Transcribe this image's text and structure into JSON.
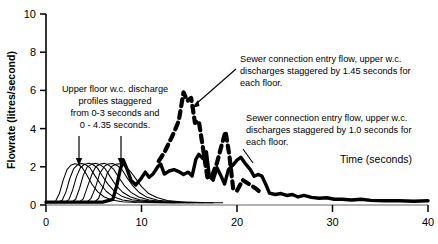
{
  "chart_data": {
    "type": "line",
    "title": "",
    "xlabel": "Time (seconds)",
    "ylabel": "Flowrate (litres/second)",
    "xlim": [
      0,
      40
    ],
    "ylim": [
      0,
      10
    ],
    "xticks": [
      0,
      10,
      20,
      30,
      40
    ],
    "yticks": [
      0,
      2,
      4,
      6,
      8,
      10
    ],
    "grid": false,
    "legend": "none",
    "series": [
      {
        "name": "Upper floor w.c. discharge profile 1",
        "style": "thin-solid",
        "points": [
          [
            0.6,
            0.12
          ],
          [
            1.0,
            0.2
          ],
          [
            1.4,
            0.6
          ],
          [
            1.8,
            1.3
          ],
          [
            2.2,
            1.85
          ],
          [
            2.6,
            2.08
          ],
          [
            3.0,
            2.16
          ],
          [
            3.4,
            2.12
          ],
          [
            3.8,
            1.95
          ],
          [
            4.3,
            1.55
          ],
          [
            4.8,
            1.1
          ],
          [
            5.4,
            0.7
          ],
          [
            6.1,
            0.42
          ],
          [
            7.0,
            0.25
          ],
          [
            8.0,
            0.17
          ],
          [
            9.5,
            0.13
          ],
          [
            11.5,
            0.12
          ],
          [
            13.5,
            0.12
          ]
        ]
      },
      {
        "name": "Upper floor w.c. discharge profile 2",
        "style": "thin-solid",
        "points": [
          [
            1.2,
            0.12
          ],
          [
            1.7,
            0.25
          ],
          [
            2.1,
            0.7
          ],
          [
            2.5,
            1.4
          ],
          [
            2.9,
            1.9
          ],
          [
            3.3,
            2.1
          ],
          [
            3.7,
            2.17
          ],
          [
            4.1,
            2.13
          ],
          [
            4.6,
            1.95
          ],
          [
            5.1,
            1.55
          ],
          [
            5.7,
            1.1
          ],
          [
            6.3,
            0.72
          ],
          [
            7.0,
            0.45
          ],
          [
            8.0,
            0.26
          ],
          [
            9.2,
            0.18
          ],
          [
            10.8,
            0.14
          ],
          [
            12.5,
            0.12
          ],
          [
            14.0,
            0.12
          ]
        ]
      },
      {
        "name": "Upper floor w.c. discharge profile 3",
        "style": "thin-solid",
        "points": [
          [
            1.9,
            0.12
          ],
          [
            2.4,
            0.28
          ],
          [
            2.8,
            0.8
          ],
          [
            3.2,
            1.5
          ],
          [
            3.6,
            1.95
          ],
          [
            4.0,
            2.12
          ],
          [
            4.5,
            2.18
          ],
          [
            4.9,
            2.12
          ],
          [
            5.4,
            1.93
          ],
          [
            5.9,
            1.52
          ],
          [
            6.5,
            1.08
          ],
          [
            7.2,
            0.7
          ],
          [
            8.0,
            0.44
          ],
          [
            9.0,
            0.27
          ],
          [
            10.3,
            0.19
          ],
          [
            12.0,
            0.14
          ],
          [
            13.5,
            0.12
          ],
          [
            15.0,
            0.12
          ]
        ]
      },
      {
        "name": "Upper floor w.c. discharge profile 4",
        "style": "thin-solid",
        "points": [
          [
            2.6,
            0.12
          ],
          [
            3.1,
            0.3
          ],
          [
            3.5,
            0.85
          ],
          [
            3.9,
            1.55
          ],
          [
            4.3,
            1.98
          ],
          [
            4.8,
            2.14
          ],
          [
            5.2,
            2.18
          ],
          [
            5.7,
            2.1
          ],
          [
            6.2,
            1.9
          ],
          [
            6.7,
            1.5
          ],
          [
            7.3,
            1.05
          ],
          [
            8.0,
            0.68
          ],
          [
            8.8,
            0.43
          ],
          [
            9.8,
            0.27
          ],
          [
            11.2,
            0.19
          ],
          [
            12.8,
            0.14
          ],
          [
            14.2,
            0.12
          ],
          [
            15.5,
            0.12
          ]
        ]
      },
      {
        "name": "Upper floor w.c. discharge profile 5",
        "style": "thin-solid",
        "points": [
          [
            3.4,
            0.12
          ],
          [
            3.9,
            0.32
          ],
          [
            4.3,
            0.9
          ],
          [
            4.8,
            1.6
          ],
          [
            5.2,
            2.0
          ],
          [
            5.7,
            2.15
          ],
          [
            6.1,
            2.18
          ],
          [
            6.6,
            2.08
          ],
          [
            7.1,
            1.86
          ],
          [
            7.6,
            1.46
          ],
          [
            8.2,
            1.02
          ],
          [
            8.9,
            0.66
          ],
          [
            9.7,
            0.42
          ],
          [
            10.8,
            0.26
          ],
          [
            12.2,
            0.18
          ],
          [
            13.8,
            0.14
          ],
          [
            15.2,
            0.12
          ],
          [
            16.5,
            0.12
          ]
        ]
      },
      {
        "name": "Upper floor w.c. discharge profile 6",
        "style": "thin-solid",
        "points": [
          [
            4.2,
            0.12
          ],
          [
            4.7,
            0.33
          ],
          [
            5.2,
            0.95
          ],
          [
            5.6,
            1.62
          ],
          [
            6.1,
            2.02
          ],
          [
            6.5,
            2.15
          ],
          [
            7.0,
            2.17
          ],
          [
            7.5,
            2.05
          ],
          [
            8.0,
            1.82
          ],
          [
            8.5,
            1.42
          ],
          [
            9.1,
            1.0
          ],
          [
            9.8,
            0.64
          ],
          [
            10.6,
            0.4
          ],
          [
            11.7,
            0.25
          ],
          [
            13.1,
            0.18
          ],
          [
            14.6,
            0.14
          ],
          [
            16.0,
            0.12
          ],
          [
            17.5,
            0.12
          ]
        ]
      },
      {
        "name": "Upper floor w.c. discharge profile 7",
        "style": "thin-solid",
        "points": [
          [
            5.0,
            0.12
          ],
          [
            5.5,
            0.34
          ],
          [
            6.0,
            0.98
          ],
          [
            6.4,
            1.65
          ],
          [
            6.9,
            2.03
          ],
          [
            7.4,
            2.15
          ],
          [
            7.8,
            2.16
          ],
          [
            8.3,
            2.02
          ],
          [
            8.8,
            1.78
          ],
          [
            9.4,
            1.38
          ],
          [
            10.0,
            0.96
          ],
          [
            10.7,
            0.62
          ],
          [
            11.6,
            0.39
          ],
          [
            12.7,
            0.24
          ],
          [
            14.1,
            0.17
          ],
          [
            15.6,
            0.14
          ],
          [
            17.0,
            0.12
          ],
          [
            18.5,
            0.12
          ]
        ]
      },
      {
        "name": "Sewer connection entry flow, 1.0 second stagger",
        "style": "thick-solid",
        "points": [
          [
            0.0,
            0.15
          ],
          [
            2.0,
            0.15
          ],
          [
            4.0,
            0.15
          ],
          [
            6.0,
            0.16
          ],
          [
            7.0,
            0.3
          ],
          [
            7.4,
            1.0
          ],
          [
            7.8,
            1.9
          ],
          [
            8.1,
            2.35
          ],
          [
            8.5,
            1.85
          ],
          [
            8.9,
            1.3
          ],
          [
            9.4,
            1.05
          ],
          [
            9.9,
            1.35
          ],
          [
            10.4,
            1.72
          ],
          [
            10.8,
            1.45
          ],
          [
            11.2,
            1.62
          ],
          [
            11.7,
            2.0
          ],
          [
            12.0,
            2.15
          ],
          [
            12.4,
            1.62
          ],
          [
            12.9,
            1.78
          ],
          [
            13.4,
            1.85
          ],
          [
            13.9,
            1.75
          ],
          [
            14.4,
            1.6
          ],
          [
            14.9,
            1.72
          ],
          [
            15.3,
            1.52
          ],
          [
            15.7,
            2.4
          ],
          [
            16.0,
            2.65
          ],
          [
            16.4,
            2.45
          ],
          [
            16.8,
            2.78
          ],
          [
            17.1,
            1.5
          ],
          [
            17.5,
            1.3
          ],
          [
            17.9,
            1.95
          ],
          [
            18.3,
            1.55
          ],
          [
            18.7,
            1.1
          ],
          [
            19.1,
            1.85
          ],
          [
            19.6,
            2.1
          ],
          [
            20.0,
            2.35
          ],
          [
            20.4,
            2.5
          ],
          [
            20.9,
            2.15
          ],
          [
            21.4,
            1.85
          ],
          [
            21.8,
            1.5
          ],
          [
            22.2,
            1.6
          ],
          [
            22.6,
            1.52
          ],
          [
            23.0,
            1.1
          ],
          [
            23.4,
            0.62
          ],
          [
            24.0,
            0.55
          ],
          [
            24.6,
            0.6
          ],
          [
            25.2,
            0.5
          ],
          [
            25.8,
            0.55
          ],
          [
            26.4,
            0.42
          ],
          [
            27.0,
            0.5
          ],
          [
            27.8,
            0.4
          ],
          [
            28.6,
            0.35
          ],
          [
            29.4,
            0.38
          ],
          [
            30.2,
            0.3
          ],
          [
            31.0,
            0.3
          ],
          [
            32.0,
            0.26
          ],
          [
            33.0,
            0.3
          ],
          [
            34.0,
            0.24
          ],
          [
            35.5,
            0.22
          ],
          [
            37.0,
            0.22
          ],
          [
            38.5,
            0.2
          ],
          [
            40.0,
            0.22
          ]
        ]
      },
      {
        "name": "Sewer connection entry flow, 1.45 second stagger",
        "style": "thick-dashed",
        "points": [
          [
            11.8,
            2.3
          ],
          [
            12.4,
            2.75
          ],
          [
            13.4,
            3.8
          ],
          [
            13.9,
            4.4
          ],
          [
            14.4,
            5.9
          ],
          [
            14.8,
            5.45
          ],
          [
            15.2,
            5.6
          ],
          [
            15.6,
            4.3
          ],
          [
            16.0,
            4.4
          ],
          [
            16.4,
            3.1
          ],
          [
            16.9,
            1.45
          ],
          [
            17.4,
            1.55
          ],
          [
            17.9,
            2.2
          ],
          [
            18.4,
            3.15
          ],
          [
            18.8,
            3.85
          ],
          [
            19.2,
            2.6
          ],
          [
            19.6,
            0.85
          ],
          [
            20.0,
            0.75
          ],
          [
            20.6,
            1.3
          ],
          [
            21.4,
            1.05
          ],
          [
            22.0,
            0.85
          ],
          [
            22.6,
            0.6
          ]
        ]
      }
    ],
    "annotations": [
      {
        "id": "annot-upper-floor",
        "text_lines": [
          "Upper floor w.c. discharge",
          "profiles staggered",
          "from 0-3 seconds and",
          "0 - 4.35 seconds."
        ],
        "pointers": "two-down-arrows"
      },
      {
        "id": "annot-sewer-145",
        "text_lines": [
          "Sewer connection entry flow, upper w.c.",
          "discharges staggered by 1.45 seconds for",
          "each floor."
        ],
        "pointers": "leader-line"
      },
      {
        "id": "annot-sewer-10",
        "text_lines": [
          "Sewer connection entry flow, upper w.c.",
          "discharges staggered by 1.0 seconds for",
          "each floor."
        ],
        "pointers": "leader-line"
      }
    ],
    "colors": {
      "line": "#000000",
      "axis": "#000000",
      "background": "#ffffff"
    }
  }
}
